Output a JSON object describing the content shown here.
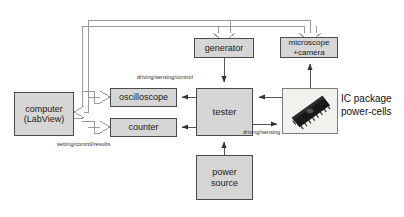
{
  "diagram": {
    "background": "#ffffff",
    "node_fill": "#d6d6d6",
    "node_stroke": "#4a4a4a",
    "line_color": "#555555",
    "bus_color": "#8a8a8a"
  },
  "nodes": {
    "computer": {
      "label": "computer\n(LabView)"
    },
    "oscilloscope": {
      "label": "oscilloscope"
    },
    "counter": {
      "label": "counter"
    },
    "tester": {
      "label": "tester"
    },
    "generator": {
      "label": "generator"
    },
    "microscope": {
      "label": "microscope\n+camera"
    },
    "power_source": {
      "label": "power\nsource"
    },
    "ic_photo": {
      "label": "dip-ic-package-photo"
    }
  },
  "captions": {
    "ic_package": "IC package\npower-cells"
  },
  "edge_labels": {
    "driving_sensing_control": "driving/sensing/control",
    "setting_control_results": "setting/control/results",
    "driving_sensing": "driving/sensing"
  },
  "connections": [
    {
      "from": "computer",
      "to": "oscilloscope",
      "style": "hollow-bus"
    },
    {
      "from": "computer",
      "to": "counter",
      "style": "hollow-bus"
    },
    {
      "from": "computer",
      "to": "generator",
      "style": "hollow-bus"
    },
    {
      "from": "computer",
      "to": "microscope",
      "style": "hollow-bus"
    },
    {
      "from": "oscilloscope",
      "to": "computer",
      "style": "hollow-bus"
    },
    {
      "from": "tester",
      "to": "oscilloscope",
      "style": "solid-arrow"
    },
    {
      "from": "tester",
      "to": "counter",
      "style": "solid-arrow"
    },
    {
      "from": "generator",
      "to": "tester",
      "style": "solid-arrow"
    },
    {
      "from": "ic_photo",
      "to": "tester",
      "style": "solid-arrow"
    },
    {
      "from": "tester",
      "to": "ic_photo",
      "style": "solid-arrow"
    },
    {
      "from": "ic_photo",
      "to": "microscope",
      "style": "solid-arrow"
    },
    {
      "from": "power_source",
      "to": "tester",
      "style": "solid-arrow"
    }
  ]
}
